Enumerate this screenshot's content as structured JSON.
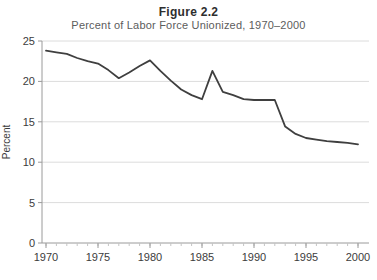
{
  "figure": {
    "title": "Figure 2.2",
    "subtitle": "Percent of Labor Force Unionized, 1970–2000"
  },
  "chart_data": {
    "type": "line",
    "title": "Figure 2.2",
    "subtitle": "Percent of Labor Force Unionized, 1970–2000",
    "xlabel": "",
    "ylabel": "Percent",
    "x": [
      1970,
      1971,
      1972,
      1973,
      1974,
      1975,
      1976,
      1977,
      1978,
      1979,
      1980,
      1981,
      1982,
      1983,
      1984,
      1985,
      1986,
      1987,
      1988,
      1989,
      1990,
      1991,
      1992,
      1993,
      1994,
      1995,
      1996,
      1997,
      1998,
      1999,
      2000
    ],
    "values": [
      23.8,
      23.6,
      23.4,
      22.9,
      22.5,
      22.2,
      21.4,
      20.4,
      21.1,
      21.9,
      22.6,
      21.3,
      20.1,
      19.0,
      18.3,
      17.8,
      21.3,
      18.7,
      18.3,
      17.8,
      17.7,
      17.7,
      17.7,
      14.4,
      13.5,
      13.0,
      12.8,
      12.6,
      12.5,
      12.4,
      12.2
    ],
    "xlim": [
      1970,
      2000
    ],
    "ylim": [
      0,
      25
    ],
    "x_ticks": [
      1970,
      1975,
      1980,
      1985,
      1990,
      1995,
      2000
    ],
    "y_ticks": [
      0,
      5,
      10,
      15,
      20,
      25
    ],
    "x_minor_tick_interval": 1,
    "grid": "horizontal",
    "legend_position": "none",
    "colors": {
      "line": "#3f3f3f",
      "grid": "#dcdcdc",
      "axis": "#9a9a9a",
      "tick": "#9a9a9a",
      "minor_tick": "#c4c4c4",
      "tick_label": "#3c3c3c",
      "title": "#2e2e2e",
      "subtitle": "#5c5c5c"
    }
  }
}
